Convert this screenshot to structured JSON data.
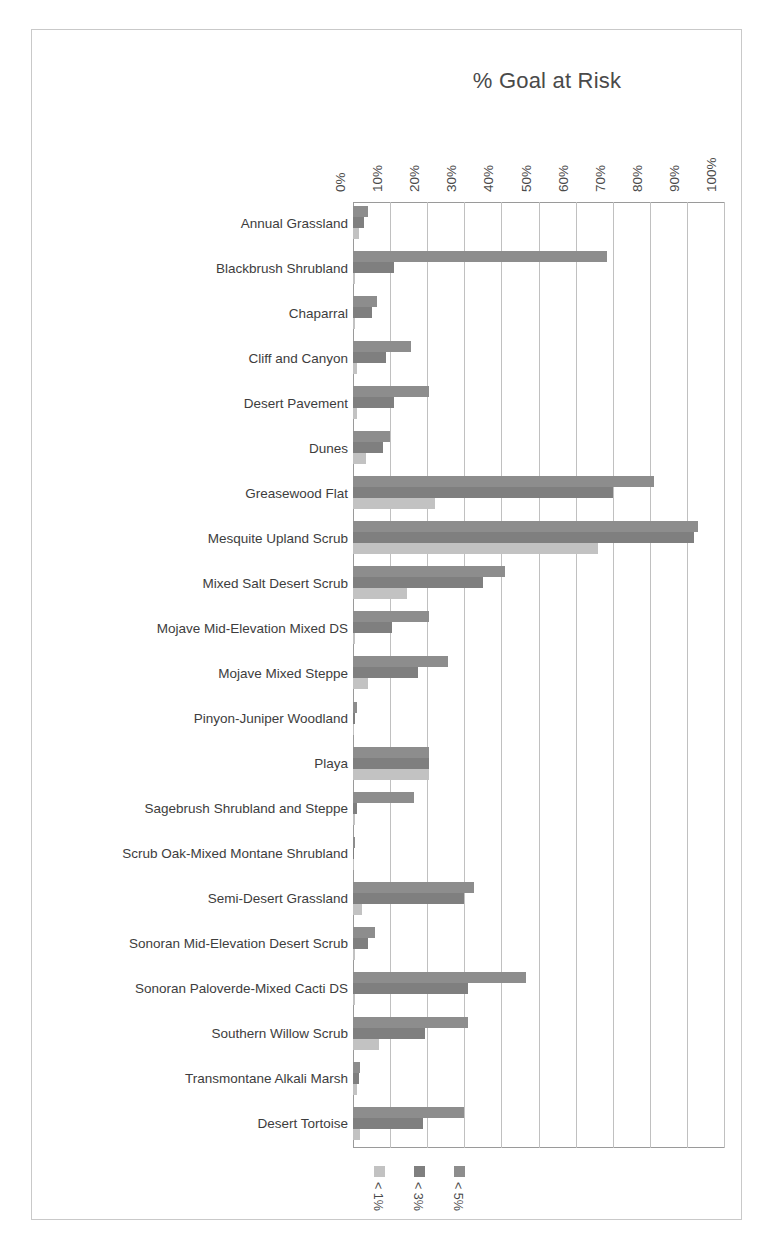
{
  "chart_data": {
    "type": "bar",
    "orientation": "horizontal",
    "title": "% Goal at Risk",
    "xlabel": "",
    "ylabel": "",
    "xlim": [
      0,
      100
    ],
    "xticks": [
      "0%",
      "10%",
      "20%",
      "30%",
      "40%",
      "50%",
      "60%",
      "70%",
      "80%",
      "90%",
      "100%"
    ],
    "xtick_values": [
      0,
      10,
      20,
      30,
      40,
      50,
      60,
      70,
      80,
      90,
      100
    ],
    "grid": "vertical",
    "legend_position": "bottom",
    "categories": [
      "Annual Grassland",
      "Blackbrush Shrubland",
      "Chaparral",
      "Cliff and Canyon",
      "Desert Pavement",
      "Dunes",
      "Greasewood Flat",
      "Mesquite Upland Scrub",
      "Mixed Salt Desert Scrub",
      "Mojave Mid-Elevation Mixed DS",
      "Mojave Mixed Steppe",
      "Pinyon-Juniper Woodland",
      "Playa",
      "Sagebrush Shrubland and Steppe",
      "Scrub Oak-Mixed Montane Shrubland",
      "Semi-Desert Grassland",
      "Sonoran Mid-Elevation Desert Scrub",
      "Sonoran Paloverde-Mixed Cacti DS",
      "Southern Willow Scrub",
      "Transmontane Alkali Marsh",
      "Desert Tortoise"
    ],
    "series": [
      {
        "name": "< 5%",
        "color": "#8d8d8d",
        "values": [
          4,
          68.5,
          6.5,
          15.5,
          20.5,
          10,
          81,
          93,
          41,
          20.5,
          25.5,
          1,
          20.5,
          16.5,
          0.5,
          32.5,
          6,
          46.5,
          31,
          2,
          30
        ]
      },
      {
        "name": "< 3%",
        "color": "#7f7f7f",
        "values": [
          3,
          11,
          5,
          9,
          11,
          8,
          70,
          92,
          35,
          10.5,
          17.5,
          0.5,
          20.5,
          1,
          0.4,
          30,
          4,
          31,
          19.5,
          1.5,
          19
        ]
      },
      {
        "name": "< 1%",
        "color": "#c2c2c2",
        "values": [
          1.5,
          0.6,
          0.6,
          1,
          1,
          3.5,
          22,
          66,
          14.5,
          0.6,
          4,
          0.3,
          20.5,
          0.6,
          0.2,
          2.5,
          0.6,
          0.6,
          7,
          1,
          2
        ]
      }
    ]
  },
  "legend": {
    "items": [
      {
        "label": "< 1%",
        "color": "#c2c2c2"
      },
      {
        "label": "< 3%",
        "color": "#7f7f7f"
      },
      {
        "label": "< 5%",
        "color": "#8d8d8d"
      }
    ]
  }
}
